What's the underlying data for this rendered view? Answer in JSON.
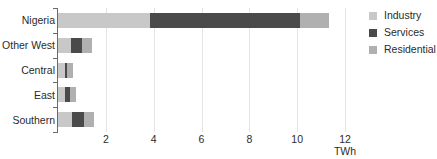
{
  "chart_data": {
    "type": "bar",
    "orientation": "horizontal",
    "stacked": true,
    "title": "",
    "xlabel": "TWh",
    "ylabel": "",
    "categories": [
      "Nigeria",
      "Other West",
      "Central",
      "East",
      "Southern"
    ],
    "series": [
      {
        "name": "Industry",
        "color": "#c8c8c8",
        "values": [
          3.85,
          0.55,
          0.3,
          0.3,
          0.58
        ]
      },
      {
        "name": "Services",
        "color": "#4a4a4a",
        "values": [
          6.25,
          0.46,
          0.08,
          0.22,
          0.5
        ]
      },
      {
        "name": "Residential",
        "color": "#b0b0b0",
        "values": [
          1.25,
          0.42,
          0.24,
          0.24,
          0.42
        ]
      }
    ],
    "totals": [
      11.35,
      1.43,
      0.62,
      0.76,
      1.5
    ],
    "xlim": [
      0,
      12.0
    ],
    "xticks": [
      2,
      4,
      6,
      8,
      10,
      12
    ],
    "xtick_labels": [
      "2",
      "4",
      "6",
      "8",
      "10",
      "12"
    ],
    "grid": "vertical",
    "legend_position": "right",
    "legend": [
      "Industry",
      "Services",
      "Residential"
    ]
  }
}
